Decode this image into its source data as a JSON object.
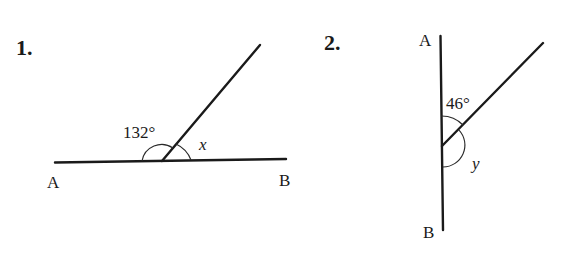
{
  "problems": [
    {
      "number": "1.",
      "line_labels": {
        "left": "A",
        "right": "B"
      },
      "known_angle": "132°",
      "unknown_angle": "x"
    },
    {
      "number": "2.",
      "line_labels": {
        "top": "A",
        "bottom": "B"
      },
      "known_angle": "46°",
      "unknown_angle": "y"
    }
  ],
  "colors": {
    "ink": "#1a1a1a",
    "background": "#ffffff"
  }
}
